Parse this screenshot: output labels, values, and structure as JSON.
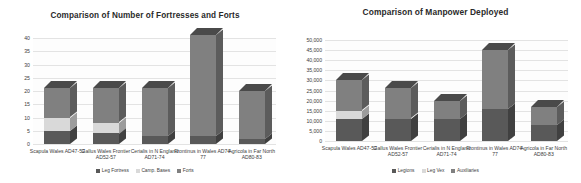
{
  "charts": [
    {
      "id": "fortresses-chart",
      "title": "Comparison of Number of Fortresses and Forts",
      "legend": [
        {
          "label": "Leg Fortress",
          "color": "#595959"
        },
        {
          "label": "Camp. Bases",
          "color": "#d9d9d9"
        },
        {
          "label": "Forts",
          "color": "#808080"
        }
      ],
      "chart_data": {
        "type": "bar",
        "stacked": true,
        "title": "Comparison of Number of Fortresses and Forts",
        "xlabel": "",
        "ylabel": "",
        "ylim": [
          0,
          40
        ],
        "ytick_step": 5,
        "yticks": [
          "40",
          "35",
          "30",
          "25",
          "20",
          "15",
          "10",
          "5",
          "0"
        ],
        "grid": true,
        "legend_position": "bottom",
        "categories": [
          "Scapula Wales AD47-52",
          "Gallus Wales Frontier AD52-57",
          "Cerialis in N England AD71-74",
          "Frontinus in Wales AD74-77",
          "Agricola in Far North AD80-83"
        ],
        "series": [
          {
            "name": "Leg Fortress",
            "values": [
              5,
              4,
              3,
              3,
              2
            ]
          },
          {
            "name": "Camp. Bases",
            "values": [
              5,
              4,
              0,
              0,
              0
            ]
          },
          {
            "name": "Forts",
            "values": [
              11,
              13,
              18,
              38,
              18
            ]
          }
        ],
        "totals": [
          21,
          21,
          21,
          41,
          20
        ]
      }
    },
    {
      "id": "manpower-chart",
      "title": "Comparison of Manpower Deployed",
      "legend": [
        {
          "label": "Legions",
          "color": "#595959"
        },
        {
          "label": "Leg Vex",
          "color": "#d9d9d9"
        },
        {
          "label": "Auxiliaries",
          "color": "#808080"
        }
      ],
      "chart_data": {
        "type": "bar",
        "stacked": true,
        "title": "Comparison of Manpower Deployed",
        "xlabel": "",
        "ylabel": "",
        "ylim": [
          0,
          50000
        ],
        "ytick_step": 5000,
        "yticks": [
          "50,000",
          "45,000",
          "40,000",
          "35,000",
          "30,000",
          "25,000",
          "20,000",
          "15,000",
          "10,000",
          "5,000",
          "0"
        ],
        "grid": true,
        "legend_position": "bottom",
        "categories": [
          "Scapula Wales AD47-52",
          "Gallus Wales Frontier AD52-57",
          "Cerialis in N England AD71-74",
          "Frontinus in Wales AD74-77",
          "Agricola in Far North AD80-83"
        ],
        "series": [
          {
            "name": "Legions",
            "values": [
              11000,
              11000,
              11000,
              16000,
              8000
            ]
          },
          {
            "name": "Leg Vex",
            "values": [
              4000,
              0,
              0,
              0,
              0
            ]
          },
          {
            "name": "Auxiliaries",
            "values": [
              15000,
              15000,
              9000,
              29000,
              9000
            ]
          }
        ],
        "totals": [
          30000,
          26000,
          20000,
          45000,
          17000
        ]
      }
    }
  ]
}
